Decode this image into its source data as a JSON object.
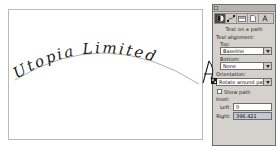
{
  "canvas": {
    "artwork_text": "Utopia Limited",
    "path_description": "text-on-arc",
    "background_color": "#ffffff",
    "border_color": "#b9b9b9",
    "text_color": "#1a1a1a",
    "path_color": "#6b6b6b"
  },
  "cursor": {
    "icon": "text-on-path-cursor-icon"
  },
  "dialog": {
    "title": "Text on a path",
    "titlebar_button": "window-menu-box",
    "toolbar": [
      {
        "icon": "contrast-circle-icon",
        "selected": true
      },
      {
        "icon": "node-edit-icon",
        "selected": false
      },
      {
        "icon": "fill-gradient-icon",
        "selected": false
      },
      {
        "icon": "page-document-icon",
        "selected": false
      },
      {
        "icon": "text-letter-a-icon",
        "selected": false
      }
    ],
    "sections": {
      "text_alignment": {
        "label": "Text alignment:",
        "top": {
          "label": "Top:",
          "value": "Baseline"
        },
        "bottom": {
          "label": "Bottom:",
          "value": "None"
        }
      },
      "orientation": {
        "label": "Orientation:",
        "value": "Rotate around path"
      },
      "show_path": {
        "label": "Show path",
        "checked": false
      },
      "inset": {
        "label": "Inset:",
        "left": {
          "label": "Left:",
          "value": "0"
        },
        "right": {
          "label": "Right:",
          "value": "396.421"
        }
      }
    }
  },
  "colors": {
    "dialog_face": "#d5d2cd",
    "dialog_border": "#6f6d6a",
    "field_bg": "#ffffff",
    "selected_field_bg": "#c3c8d6",
    "toolbar_selected": "#4c4a47"
  }
}
